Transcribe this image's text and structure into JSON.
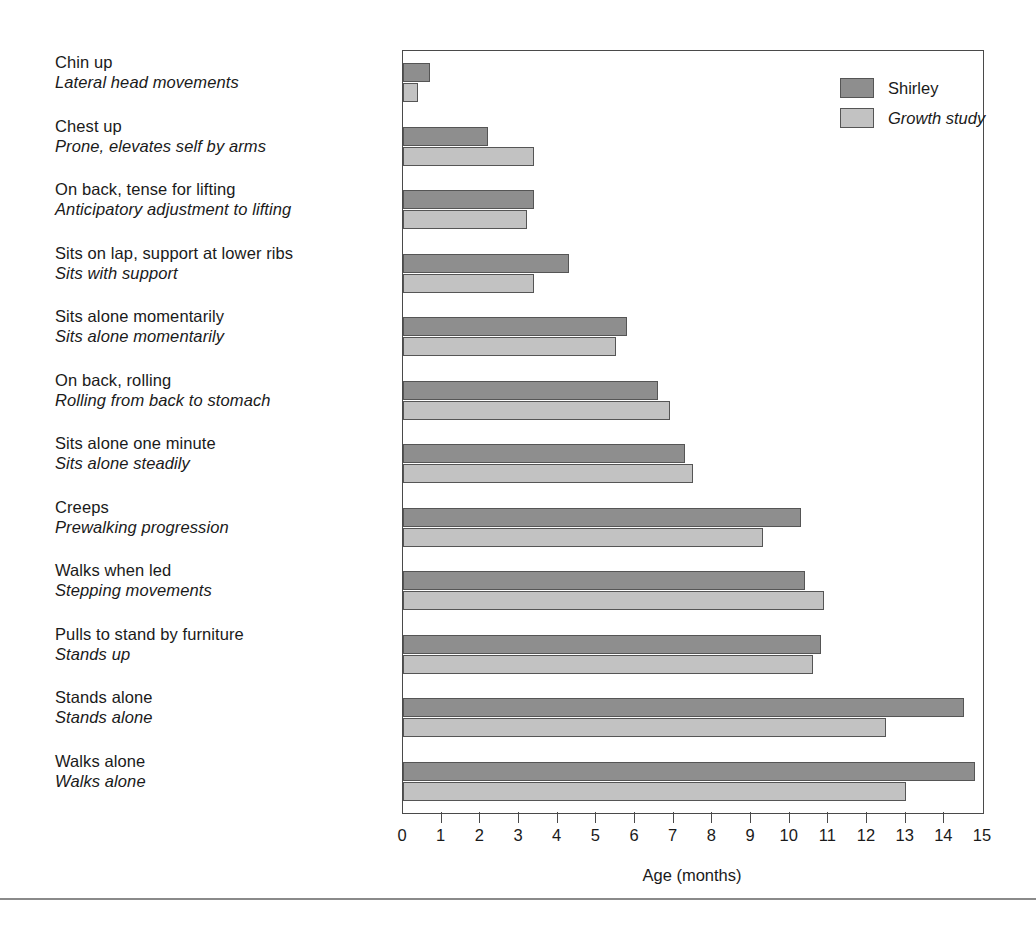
{
  "chart_data": {
    "type": "bar",
    "orientation": "horizontal",
    "title": "",
    "xlabel": "Age (months)",
    "ylabel": "",
    "xlim": [
      0,
      15
    ],
    "xticks": [
      0,
      1,
      2,
      3,
      4,
      5,
      6,
      7,
      8,
      9,
      10,
      11,
      12,
      13,
      14,
      15
    ],
    "xtick_labels": [
      "0",
      "1",
      "2",
      "3",
      "4",
      "5",
      "6",
      "7",
      "8",
      "9",
      "10",
      "11",
      "12",
      "13",
      "14",
      "15"
    ],
    "grid": false,
    "legend_position": "top-right",
    "categories": [
      "Chin up / Lateral head movements",
      "Chest up / Prone, elevates self by arms",
      "On back, tense for lifting / Anticipatory adjustment to lifting",
      "Sits on lap, support at lower ribs / Sits with support",
      "Sits alone momentarily / Sits alone momentarily",
      "On back, rolling / Rolling from back to stomach",
      "Sits alone one minute / Sits alone steadily",
      "Creeps / Prewalking progression",
      "Walks when led / Stepping movements",
      "Pulls to stand by furniture / Stands up",
      "Stands alone / Stands alone",
      "Walks alone / Walks alone"
    ],
    "series": [
      {
        "name": "Shirley",
        "color": "#8e8e8e",
        "values": [
          0.7,
          2.2,
          3.4,
          4.3,
          5.8,
          6.6,
          7.3,
          10.3,
          10.4,
          10.8,
          14.5,
          14.8
        ]
      },
      {
        "name": "Growth study",
        "color": "#c2c2c2",
        "values": [
          0.4,
          3.4,
          3.2,
          3.4,
          5.5,
          6.9,
          7.5,
          9.3,
          10.9,
          10.6,
          12.5,
          13.0
        ]
      }
    ]
  },
  "legend": {
    "items": [
      {
        "label": "Shirley",
        "style": "roman",
        "swatch": "dark-gray-swatch"
      },
      {
        "label": "Growth study",
        "style": "italic",
        "swatch": "light-gray-swatch"
      }
    ]
  },
  "categories": [
    {
      "shirley": "Chin up",
      "growth": "Lateral head movements"
    },
    {
      "shirley": "Chest up",
      "growth": "Prone, elevates self by arms"
    },
    {
      "shirley": "On back, tense for lifting",
      "growth": "Anticipatory adjustment to lifting"
    },
    {
      "shirley": "Sits on lap, support at lower ribs",
      "growth": "Sits with support"
    },
    {
      "shirley": "Sits alone momentarily",
      "growth": "Sits alone momentarily"
    },
    {
      "shirley": "On back, rolling",
      "growth": "Rolling from back to stomach"
    },
    {
      "shirley": "Sits alone one minute",
      "growth": "Sits alone steadily"
    },
    {
      "shirley": "Creeps",
      "growth": "Prewalking progression"
    },
    {
      "shirley": "Walks when led",
      "growth": "Stepping movements"
    },
    {
      "shirley": "Pulls to stand by furniture",
      "growth": "Stands up"
    },
    {
      "shirley": "Stands alone",
      "growth": "Stands alone"
    },
    {
      "shirley": "Walks alone",
      "growth": "Walks alone"
    }
  ],
  "axis": {
    "title": "Age (months)",
    "ticks": [
      "0",
      "1",
      "2",
      "3",
      "4",
      "5",
      "6",
      "7",
      "8",
      "9",
      "10",
      "11",
      "12",
      "13",
      "14",
      "15"
    ]
  },
  "colors": {
    "shirley_bar": "#8e8e8e",
    "growth_bar": "#c2c2c2",
    "bar_outline": "#555555",
    "frame": "#4a4a4a",
    "text": "#1a1a1a",
    "background": "#ffffff"
  }
}
